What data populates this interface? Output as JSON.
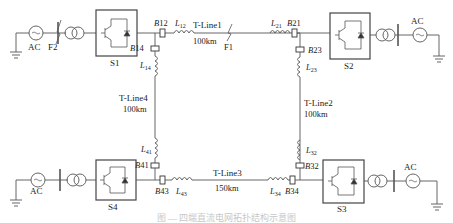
{
  "diagram": {
    "type": "four-terminal ring MMC/VSC HVDC grid",
    "colors": {
      "line": "#555555",
      "text": "#222222",
      "box": "#444444"
    },
    "stations": [
      {
        "id": "S1",
        "label": "S1",
        "ac_label": "AC",
        "fault_label": "F2"
      },
      {
        "id": "S2",
        "label": "S2",
        "ac_label": "AC"
      },
      {
        "id": "S3",
        "label": "S3",
        "ac_label": "AC"
      },
      {
        "id": "S4",
        "label": "S4",
        "ac_label": "AC"
      }
    ],
    "lines": [
      {
        "name": "T-Line1",
        "length": "100km",
        "fault": "F1"
      },
      {
        "name": "T-Line2",
        "length": "100km"
      },
      {
        "name": "T-Line3",
        "length": "150km"
      },
      {
        "name": "T-Line4",
        "length": "100km"
      }
    ],
    "breakers": {
      "B12": {
        "b": "B",
        "n": "12"
      },
      "B21": {
        "b": "B",
        "n": "21"
      },
      "B23": {
        "b": "B",
        "n": "23"
      },
      "B32": {
        "b": "B",
        "n": "32"
      },
      "B34": {
        "b": "B",
        "n": "34"
      },
      "B43": {
        "b": "B",
        "n": "43"
      },
      "B41": {
        "b": "B",
        "n": "41"
      },
      "B14": {
        "b": "B",
        "n": "14"
      }
    },
    "inductors": {
      "L12": {
        "l": "L",
        "n": "12"
      },
      "L21": {
        "l": "L",
        "n": "21"
      },
      "L23": {
        "l": "L",
        "n": "23"
      },
      "L32": {
        "l": "L",
        "n": "32"
      },
      "L34": {
        "l": "L",
        "n": "34"
      },
      "L43": {
        "l": "L",
        "n": "43"
      },
      "L41": {
        "l": "L",
        "n": "41"
      },
      "L14": {
        "l": "L",
        "n": "14"
      }
    },
    "caption": "图 — 四端直流电网拓扑结构示意图"
  }
}
